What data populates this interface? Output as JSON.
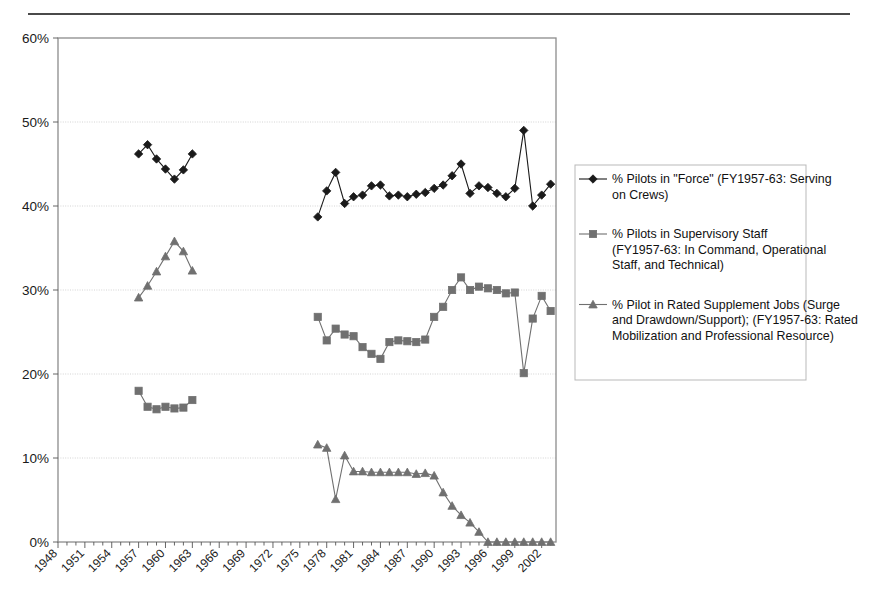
{
  "chart_data": {
    "type": "line",
    "title": "",
    "xlabel": "",
    "ylabel": "",
    "xlim": [
      1948,
      2003
    ],
    "ylim": [
      0,
      0.6
    ],
    "ytick_labels": [
      "0%",
      "10%",
      "20%",
      "30%",
      "40%",
      "50%",
      "60%"
    ],
    "ytick_values": [
      0,
      10,
      20,
      30,
      40,
      50,
      60
    ],
    "xtick_labels": [
      "1948",
      "1951",
      "1954",
      "1957",
      "1960",
      "1963",
      "1966",
      "1969",
      "1972",
      "1975",
      "1978",
      "1981",
      "1984",
      "1987",
      "1990",
      "1993",
      "1996",
      "1999",
      "2002"
    ],
    "xtick_values": [
      1948,
      1951,
      1954,
      1957,
      1960,
      1963,
      1966,
      1969,
      1972,
      1975,
      1978,
      1981,
      1984,
      1987,
      1990,
      1993,
      1996,
      1999,
      2002
    ],
    "grid": true,
    "legend_position": "right",
    "series": [
      {
        "name": "% Pilots in \"Force\" (FY1957-63:  Serving on Crews)",
        "marker": "diamond",
        "color": "#1a1a1a",
        "segments": [
          {
            "x": [
              1957,
              1958,
              1959,
              1960,
              1961,
              1962,
              1963
            ],
            "y": [
              46.2,
              47.3,
              45.6,
              44.4,
              43.2,
              44.3,
              46.2
            ]
          },
          {
            "x": [
              1977,
              1978,
              1979,
              1980,
              1981,
              1982,
              1983,
              1984,
              1985,
              1986,
              1987,
              1988,
              1989,
              1990,
              1991,
              1992,
              1993,
              1994,
              1995,
              1996,
              1997,
              1998,
              1999,
              2000,
              2001,
              2002,
              2003
            ],
            "y": [
              38.7,
              41.8,
              44.0,
              40.3,
              41.1,
              41.3,
              42.4,
              42.5,
              41.2,
              41.3,
              41.1,
              41.4,
              41.6,
              42.1,
              42.5,
              43.6,
              45.0,
              41.5,
              42.4,
              42.2,
              41.5,
              41.1,
              42.1,
              49.0,
              40.0,
              41.3,
              42.6
            ]
          }
        ]
      },
      {
        "name": "% Pilots in Supervisory Staff (FY1957-63: In Command, Operational Staff, and Technical)",
        "marker": "square",
        "color": "#707070",
        "segments": [
          {
            "x": [
              1957,
              1958,
              1959,
              1960,
              1961,
              1962,
              1963
            ],
            "y": [
              18.0,
              16.1,
              15.8,
              16.1,
              15.9,
              16.0,
              16.9
            ]
          },
          {
            "x": [
              1977,
              1978,
              1979,
              1980,
              1981,
              1982,
              1983,
              1984,
              1985,
              1986,
              1987,
              1988,
              1989,
              1990,
              1991,
              1992,
              1993,
              1994,
              1995,
              1996,
              1997,
              1998,
              1999,
              2000,
              2001,
              2002,
              2003
            ],
            "y": [
              26.8,
              24.0,
              25.4,
              24.7,
              24.5,
              23.2,
              22.4,
              21.8,
              23.8,
              24.0,
              23.9,
              23.8,
              24.1,
              26.8,
              28.0,
              30.0,
              31.5,
              30.0,
              30.4,
              30.2,
              30.0,
              29.6,
              29.7,
              20.1,
              26.6,
              29.3,
              27.5
            ]
          }
        ]
      },
      {
        "name": "% Pilot in Rated Supplement Jobs (Surge and Drawdown/Support); (FY1957-63: Rated Mobilization and Professional Resource)",
        "marker": "triangle",
        "color": "#707070",
        "segments": [
          {
            "x": [
              1957,
              1958,
              1959,
              1960,
              1961,
              1962,
              1963
            ],
            "y": [
              29.1,
              30.5,
              32.2,
              34.0,
              35.8,
              34.6,
              32.3
            ]
          },
          {
            "x": [
              1977,
              1978,
              1979,
              1980,
              1981,
              1982,
              1983,
              1984,
              1985,
              1986,
              1987,
              1988,
              1989,
              1990,
              1991,
              1992,
              1993,
              1994,
              1995,
              1996,
              1997,
              1998,
              1999,
              2000,
              2001,
              2002,
              2003
            ],
            "y": [
              11.6,
              11.2,
              5.1,
              10.3,
              8.4,
              8.4,
              8.3,
              8.3,
              8.3,
              8.3,
              8.3,
              8.1,
              8.2,
              7.9,
              5.9,
              4.3,
              3.2,
              2.3,
              1.2,
              0.0,
              0.0,
              0.0,
              0.0,
              0.0,
              0.0,
              0.0,
              0.0
            ]
          }
        ]
      }
    ]
  },
  "legend": {
    "entries": [
      {
        "label": "% Pilots in \"Force\" (FY1957-63:  Serving on Crews)",
        "marker": "diamond",
        "color": "#1a1a1a"
      },
      {
        "label": "% Pilots in Supervisory Staff (FY1957-63: In Command, Operational Staff, and Technical)",
        "marker": "square",
        "color": "#707070"
      },
      {
        "label": "% Pilot in Rated Supplement Jobs (Surge and Drawdown/Support); (FY1957-63: Rated Mobilization and Professional Resource)",
        "marker": "triangle",
        "color": "#707070"
      }
    ]
  }
}
